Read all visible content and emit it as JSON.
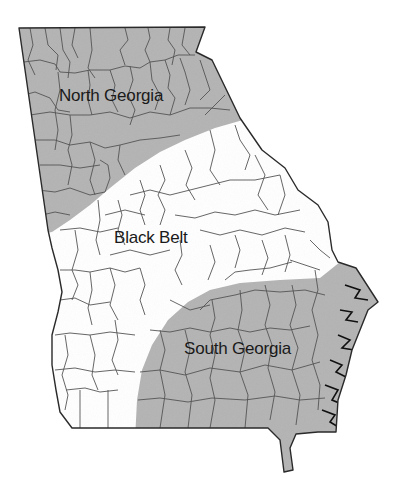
{
  "map": {
    "subject": "Georgia (U.S. state) counties by region",
    "colors": {
      "shaded_region": "#b4b4b4",
      "unshaded_region": "#ffffff",
      "county_lines": "#555555",
      "state_outline": "#2a2a2a",
      "label_text": "#1a1a1a"
    },
    "regions": [
      {
        "id": "north-georgia",
        "label": "North Georgia",
        "shaded": true
      },
      {
        "id": "black-belt",
        "label": "Black Belt",
        "shaded": false
      },
      {
        "id": "south-georgia",
        "label": "South Georgia",
        "shaded": true
      }
    ]
  }
}
